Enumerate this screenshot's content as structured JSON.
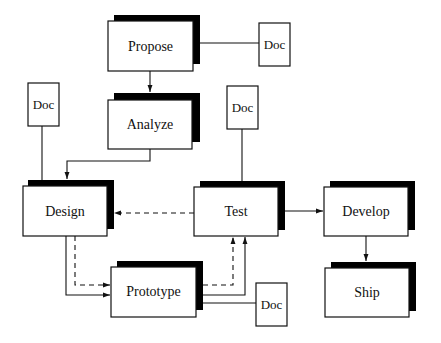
{
  "diagram": {
    "type": "process-flowchart",
    "colors": {
      "stroke": "#111111",
      "shadow": "#000000",
      "fill": "#ffffff",
      "background": "#ffffff"
    },
    "nodes": {
      "propose": {
        "label": "Propose"
      },
      "analyze": {
        "label": "Analyze"
      },
      "design": {
        "label": "Design"
      },
      "test": {
        "label": "Test"
      },
      "develop": {
        "label": "Develop"
      },
      "ship": {
        "label": "Ship"
      },
      "prototype": {
        "label": "Prototype"
      }
    },
    "docs": {
      "propose_doc": {
        "label": "Doc"
      },
      "design_doc": {
        "label": "Doc"
      },
      "test_doc": {
        "label": "Doc"
      },
      "prototype_doc": {
        "label": "Doc"
      }
    },
    "edges": [
      {
        "from": "Propose",
        "to": "Analyze",
        "style": "solid",
        "arrow": true
      },
      {
        "from": "Propose",
        "to": "Doc",
        "style": "solid",
        "arrow": false
      },
      {
        "from": "Analyze",
        "to": "Design",
        "style": "solid",
        "arrow": true
      },
      {
        "from": "Doc",
        "to": "Design",
        "style": "solid",
        "arrow": false
      },
      {
        "from": "Test",
        "to": "Design",
        "style": "dashed",
        "arrow": true
      },
      {
        "from": "Doc",
        "to": "Test",
        "style": "solid",
        "arrow": false
      },
      {
        "from": "Test",
        "to": "Develop",
        "style": "solid",
        "arrow": true
      },
      {
        "from": "Develop",
        "to": "Ship",
        "style": "solid",
        "arrow": true
      },
      {
        "from": "Design",
        "to": "Prototype",
        "style": "solid",
        "arrow": true
      },
      {
        "from": "Design",
        "to": "Prototype",
        "style": "dashed",
        "arrow": true
      },
      {
        "from": "Prototype",
        "to": "Test",
        "style": "solid",
        "arrow": true
      },
      {
        "from": "Prototype",
        "to": "Test",
        "style": "dashed",
        "arrow": true
      },
      {
        "from": "Prototype",
        "to": "Doc",
        "style": "solid",
        "arrow": false
      }
    ]
  }
}
